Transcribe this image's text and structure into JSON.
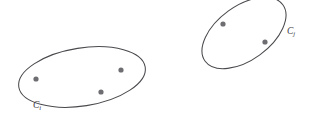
{
  "figure": {
    "width": 312,
    "height": 123,
    "background_color": "#ffffff",
    "outline_color": "#4a4a4e",
    "point_color": "#6e6e72",
    "label_color": "#3b3b3f"
  },
  "chart_data": {
    "type": "scatter",
    "title": "",
    "xlabel": "",
    "ylabel": "",
    "grid": false,
    "legend": "none",
    "xlim": [
      0,
      312
    ],
    "ylim": [
      0,
      123
    ],
    "note": "Schematic of two clusters drawn as ellipse outlines enclosing their member points.",
    "clusters": [
      {
        "id": "Ci",
        "label_base": "C",
        "label_subscript": "i",
        "label_x": 33,
        "label_y": 101,
        "ellipse": {
          "cx": 82,
          "cy": 77,
          "rx": 64,
          "ry": 29,
          "rotation_deg": -9
        },
        "point_count": 3,
        "points": [
          {
            "x": 36,
            "y": 79
          },
          {
            "x": 121,
            "y": 70
          },
          {
            "x": 101,
            "y": 92
          }
        ]
      },
      {
        "id": "Cj",
        "label_base": "C",
        "label_subscript": "j",
        "label_x": 287,
        "label_y": 27,
        "ellipse": {
          "cx": 244,
          "cy": 33,
          "rx": 48,
          "ry": 27,
          "rotation_deg": -36
        },
        "point_count": 2,
        "points": [
          {
            "x": 223,
            "y": 24
          },
          {
            "x": 265,
            "y": 42
          }
        ]
      }
    ],
    "point_radius": 2.6
  }
}
